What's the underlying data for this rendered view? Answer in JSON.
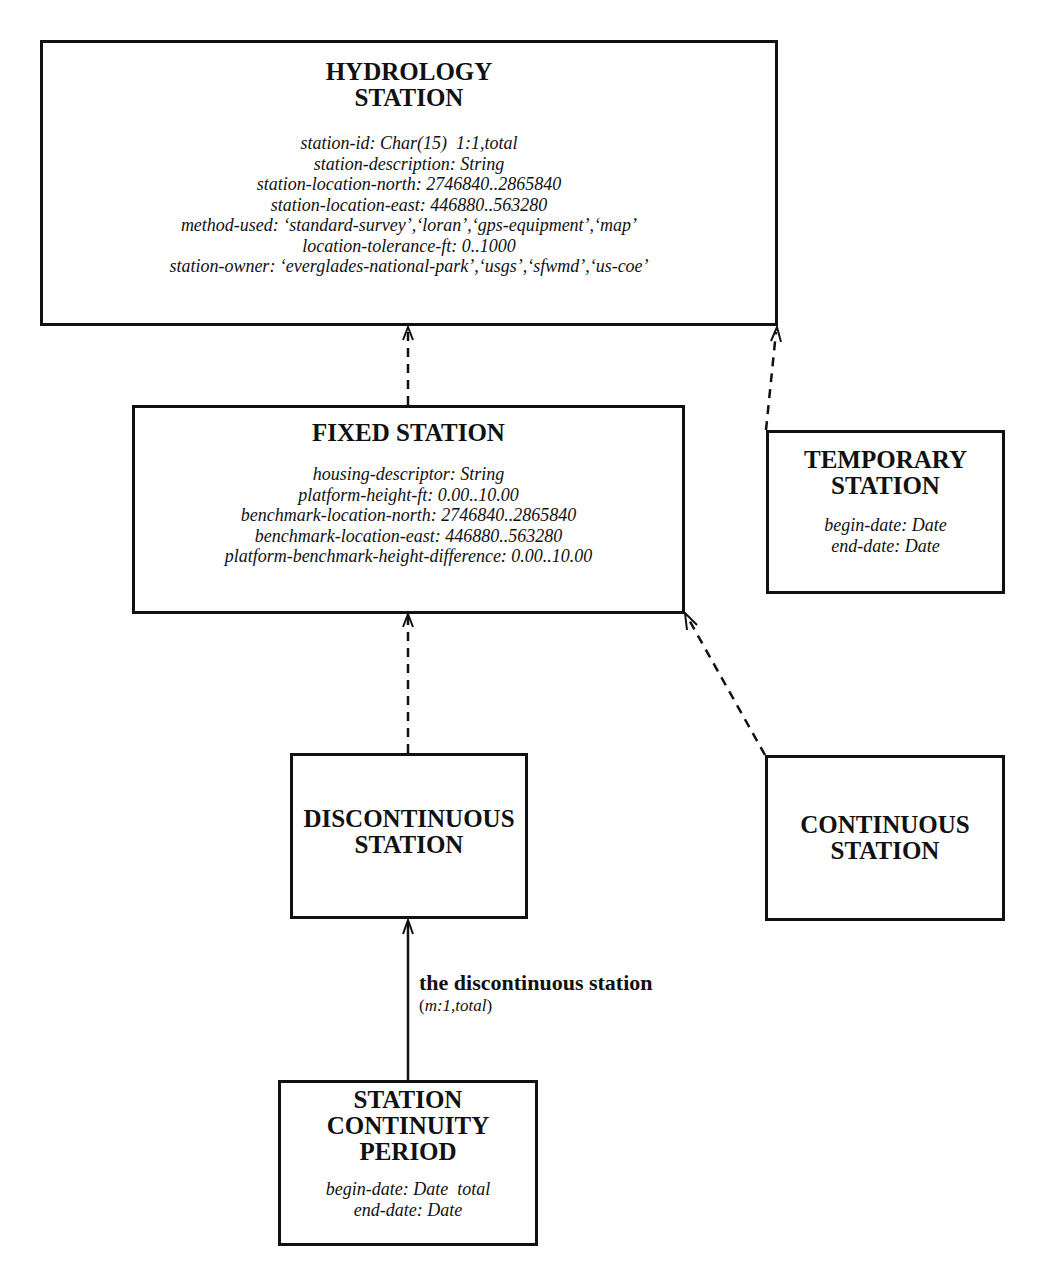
{
  "diagram": {
    "type": "entity-relationship / generalization diagram",
    "entities": {
      "hydrology_station": {
        "title": "HYDROLOGY\nSTATION",
        "attributes": [
          "station-id: Char(15)  1:1,total",
          "station-description: String",
          "station-location-north: 2746840..2865840",
          "station-location-east: 446880..563280",
          "method-used: ‘standard-survey’,‘loran’,‘gps-equipment’,‘map’",
          "location-tolerance-ft: 0..1000",
          "station-owner: ‘everglades-national-park’,‘usgs’,‘sfwmd’,‘us-coe’"
        ]
      },
      "fixed_station": {
        "title": "FIXED STATION",
        "attributes": [
          "housing-descriptor: String",
          "platform-height-ft: 0.00..10.00",
          "benchmark-location-north: 2746840..2865840",
          "benchmark-location-east: 446880..563280",
          "platform-benchmark-height-difference: 0.00..10.00"
        ]
      },
      "temporary_station": {
        "title": "TEMPORARY\nSTATION",
        "attributes": [
          "begin-date: Date",
          "end-date: Date"
        ]
      },
      "discontinuous_station": {
        "title": "DISCONTINUOUS\nSTATION",
        "attributes": []
      },
      "continuous_station": {
        "title": "CONTINUOUS\nSTATION",
        "attributes": []
      },
      "station_continuity_period": {
        "title": "STATION\nCONTINUITY\nPERIOD",
        "attributes": [
          "begin-date: Date  total",
          "end-date: Date"
        ]
      }
    },
    "relationships": [
      {
        "from": "fixed_station",
        "to": "hydrology_station",
        "kind": "generalization",
        "style": "dashed-arrow"
      },
      {
        "from": "temporary_station",
        "to": "hydrology_station",
        "kind": "generalization",
        "style": "dashed-arrow"
      },
      {
        "from": "discontinuous_station",
        "to": "fixed_station",
        "kind": "generalization",
        "style": "dashed-arrow"
      },
      {
        "from": "continuous_station",
        "to": "fixed_station",
        "kind": "generalization",
        "style": "dashed-arrow"
      },
      {
        "from": "station_continuity_period",
        "to": "discontinuous_station",
        "kind": "association",
        "style": "solid-arrow",
        "label": "the discontinuous station",
        "cardinality_open": "(",
        "cardinality": "m:1,total",
        "cardinality_close": ")"
      }
    ],
    "colors": {
      "line": "#111111",
      "background": "#ffffff"
    }
  }
}
